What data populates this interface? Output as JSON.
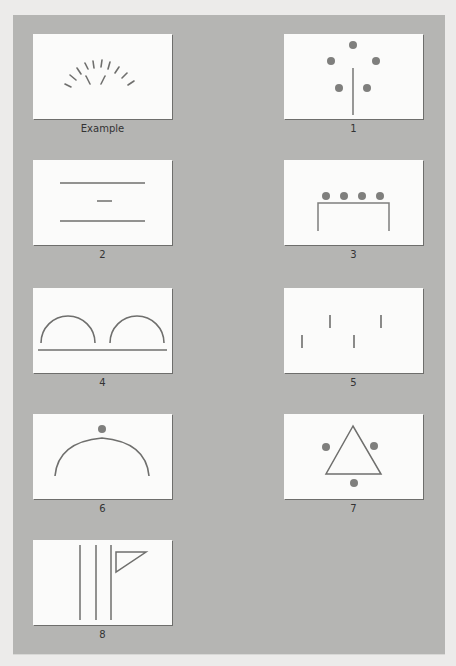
{
  "figure": {
    "panel_color": "#b5b5b3",
    "card_color": "#fbfbfa",
    "stroke_color": "#7a7a78",
    "dot_color": "#7f7f7d"
  },
  "cards": [
    {
      "id": "example",
      "label": "Example",
      "content": "10 radial tick marks forming an arc with 2 inner diagonal strokes forming a V"
    },
    {
      "id": "1",
      "label": "1",
      "content": "5 dots in a ring around a vertical line"
    },
    {
      "id": "2",
      "label": "2",
      "content": "two long horizontal lines with a short horizontal dash between them"
    },
    {
      "id": "3",
      "label": "3",
      "content": "4 dots in a row above an open rectangular bracket"
    },
    {
      "id": "4",
      "label": "4",
      "content": "two semicircular arches above a horizontal baseline"
    },
    {
      "id": "5",
      "label": "5",
      "content": "4 short vertical strokes at staggered heights"
    },
    {
      "id": "6",
      "label": "6",
      "content": "a single dot above a large arc"
    },
    {
      "id": "7",
      "label": "7",
      "content": "triangle outline with 3 dots next to its sides"
    },
    {
      "id": "8",
      "label": "8",
      "content": "three vertical lines with a triangular flag on the rightmost"
    }
  ]
}
